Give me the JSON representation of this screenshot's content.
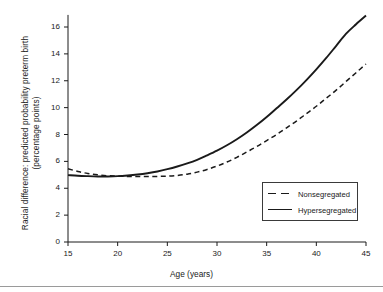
{
  "chart_data": {
    "type": "line",
    "title": "",
    "xlabel": "Age (years)",
    "ylabel_lines": [
      "Racial difference: predicted probability preterm birth",
      "(percentage points)"
    ],
    "xlim": [
      15,
      45
    ],
    "ylim": [
      0,
      17
    ],
    "xticks": [
      15,
      20,
      25,
      30,
      35,
      40,
      45
    ],
    "yticks": [
      0,
      2,
      4,
      6,
      8,
      10,
      12,
      14,
      16
    ],
    "grid": false,
    "legend_position": "lower right",
    "x": [
      15,
      16,
      17,
      18,
      19,
      20,
      21,
      22,
      23,
      24,
      25,
      26,
      27,
      28,
      29,
      30,
      31,
      32,
      33,
      34,
      35,
      36,
      37,
      38,
      39,
      40,
      41,
      42,
      43,
      44,
      45
    ],
    "series": [
      {
        "name": "Nonsegregated",
        "style": "dashed",
        "color": "#1a1a1a",
        "values": [
          5.45,
          5.25,
          5.1,
          5.0,
          4.93,
          4.9,
          4.88,
          4.87,
          4.87,
          4.88,
          4.9,
          4.95,
          5.05,
          5.2,
          5.4,
          5.65,
          5.95,
          6.3,
          6.7,
          7.1,
          7.55,
          8.0,
          8.5,
          9.0,
          9.55,
          10.1,
          10.7,
          11.3,
          11.95,
          12.6,
          13.25
        ]
      },
      {
        "name": "Hypersegregated",
        "style": "solid",
        "color": "#1a1a1a",
        "values": [
          4.98,
          4.93,
          4.9,
          4.88,
          4.88,
          4.9,
          4.95,
          5.02,
          5.12,
          5.25,
          5.42,
          5.62,
          5.85,
          6.12,
          6.45,
          6.8,
          7.2,
          7.65,
          8.15,
          8.7,
          9.3,
          9.95,
          10.6,
          11.3,
          12.05,
          12.85,
          13.7,
          14.6,
          15.5,
          16.2,
          16.85
        ]
      }
    ]
  },
  "legend": {
    "items": [
      {
        "label": "Nonsegregated"
      },
      {
        "label": "Hypersegregated"
      }
    ]
  }
}
